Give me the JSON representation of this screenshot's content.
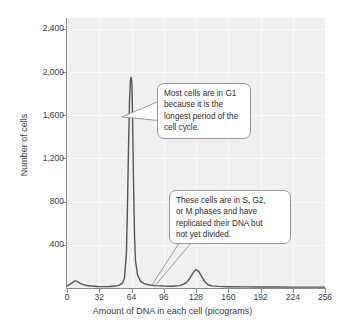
{
  "chart_data": {
    "type": "line",
    "title": "",
    "subtitle": "",
    "xlabel": "Amount of DNA in each cell (picograms)",
    "ylabel": "Number of cells",
    "xlim": [
      0,
      256
    ],
    "ylim": [
      0,
      2500
    ],
    "xticks": [
      "0",
      "32",
      "64",
      "96",
      "128",
      "160",
      "192",
      "224",
      "256"
    ],
    "xtick_values": [
      0,
      32,
      64,
      96,
      128,
      160,
      192,
      224,
      256
    ],
    "yticks": [
      "400",
      "800",
      "1,200",
      "1,600",
      "2,000",
      "2,400"
    ],
    "ytick_values": [
      400,
      800,
      1200,
      1600,
      2000,
      2400
    ],
    "grid": true,
    "legend": null,
    "series": [
      {
        "name": "Cell count distribution",
        "color": "#555555",
        "x": [
          0,
          4,
          7,
          9,
          11,
          14,
          18,
          24,
          30,
          36,
          42,
          48,
          52,
          55,
          57,
          59,
          60,
          61,
          62,
          63,
          63.5,
          64,
          64.5,
          65,
          66,
          67,
          68,
          70,
          73,
          77,
          82,
          88,
          96,
          104,
          112,
          118,
          122,
          125,
          128,
          131,
          134,
          137,
          140,
          144,
          150,
          160,
          176,
          192,
          208,
          224,
          240,
          256
        ],
        "values": [
          18,
          40,
          62,
          66,
          55,
          38,
          26,
          18,
          14,
          13,
          14,
          18,
          26,
          45,
          90,
          330,
          760,
          1290,
          1720,
          1920,
          1950,
          1945,
          1870,
          1600,
          980,
          480,
          250,
          120,
          62,
          38,
          28,
          22,
          18,
          16,
          22,
          45,
          90,
          140,
          170,
          150,
          100,
          55,
          30,
          20,
          15,
          12,
          10,
          9,
          9,
          8,
          8,
          8
        ]
      }
    ],
    "annotations": [
      {
        "id": "callout-g1",
        "target_x": 64,
        "target_y": 1450,
        "lines": [
          "Most cells are in G1",
          "because it is the",
          "longest period of the",
          "cell cycle."
        ]
      },
      {
        "id": "callout-sg2m",
        "target_x": 130,
        "target_y": 120,
        "lines": [
          "These cells are in S, G2,",
          "or M phases and have",
          "replicated their DNA but",
          "not yet divided."
        ]
      }
    ],
    "colors": {
      "plot_background": "#f0f0f0",
      "gridline": "#fbfbfb",
      "axis": "#8a8a8a",
      "curve": "#555555",
      "callout_background": "#ffffff",
      "callout_border": "#9a9a9a",
      "text": "#3a3a3a"
    }
  }
}
